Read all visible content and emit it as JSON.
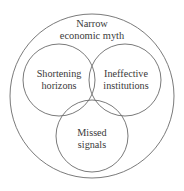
{
  "diagram": {
    "type": "venn",
    "title": "Narrow economic myth",
    "background_color": "#ffffff",
    "stroke_color": "#6b6b6b",
    "text_color": "#3a3a3a",
    "outer": {
      "label_line_1": "Narrow",
      "label_line_2": "economic myth",
      "cx": 92,
      "cy": 96,
      "r": 82
    },
    "sets": [
      {
        "id": "shortening-horizons",
        "label_line_1": "Shortening",
        "label_line_2": "horizons",
        "cx": 59,
        "cy": 80,
        "r": 36
      },
      {
        "id": "ineffective-institutions",
        "label_line_1": "Ineffective",
        "label_line_2": "institutions",
        "cx": 125,
        "cy": 80,
        "r": 36
      },
      {
        "id": "missed-signals",
        "label_line_1": "Missed",
        "label_line_2": "signals",
        "cx": 92,
        "cy": 136,
        "r": 36
      }
    ]
  }
}
